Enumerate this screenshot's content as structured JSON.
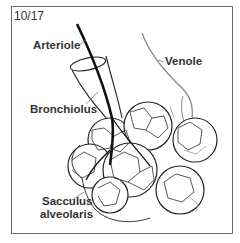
{
  "figure": {
    "number": "10/17",
    "labels": {
      "arteriole": "Arteriole",
      "venole": "Venole",
      "bronchiolus": "Bronchiolus",
      "sacculus_line1": "Sacculus",
      "sacculus_line2": "alveolaris"
    }
  },
  "colors": {
    "frame": "#6a6a6a",
    "arteriole": "#111111",
    "venole": "#8a8a8a",
    "outline": "#222222",
    "capillary_light": "#9a9a9a",
    "text": "#333333"
  }
}
